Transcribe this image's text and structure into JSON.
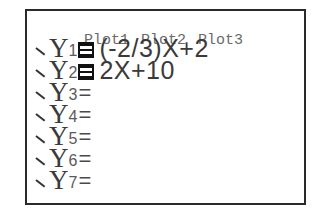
{
  "screen": {
    "plots": [
      "Plot1",
      "Plot2",
      "Plot3"
    ],
    "functions": [
      {
        "name": "Y",
        "index": "1",
        "selected": true,
        "expression": "(-2/3)X+2"
      },
      {
        "name": "Y",
        "index": "2",
        "selected": true,
        "expression": "2X+10"
      },
      {
        "name": "Y",
        "index": "3",
        "selected": false,
        "expression": ""
      },
      {
        "name": "Y",
        "index": "4",
        "selected": false,
        "expression": ""
      },
      {
        "name": "Y",
        "index": "5",
        "selected": false,
        "expression": ""
      },
      {
        "name": "Y",
        "index": "6",
        "selected": false,
        "expression": ""
      },
      {
        "name": "Y",
        "index": "7",
        "selected": false,
        "expression": ""
      }
    ],
    "equals_sign": "="
  }
}
